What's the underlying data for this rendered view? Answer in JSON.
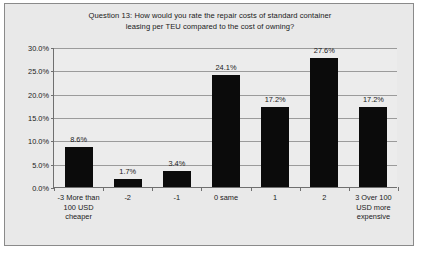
{
  "chart_data": {
    "type": "bar",
    "title": "Question 13: How would you rate the repair costs of standard container leasing per TEU compared to the cost of owning?",
    "title_line1": "Question 13: How would you rate the repair costs of standard container",
    "title_line2": "leasing per TEU compared to the cost of owning?",
    "xlabel": "",
    "ylabel": "",
    "ylim": [
      0,
      30
    ],
    "grid": true,
    "legend": "none",
    "categories": [
      "-3 More than 100 USD cheaper",
      "-2",
      "-1",
      "0 same",
      "1",
      "2",
      "3 Over 100 USD more expensive"
    ],
    "values": [
      8.6,
      1.7,
      3.4,
      24.1,
      17.2,
      27.6,
      17.2
    ],
    "data_labels": [
      "8.6%",
      "1.7%",
      "3.4%",
      "24.1%",
      "17.2%",
      "27.6%",
      "17.2%"
    ],
    "ytick_labels": [
      "0.0%",
      "5.0%",
      "10.0%",
      "15.0%",
      "20.0%",
      "25.0%",
      "30.0%"
    ],
    "ytick_values": [
      0,
      5,
      10,
      15,
      20,
      25,
      30
    ],
    "bar_color": "#0b0b0b",
    "plot_background": "#ececec",
    "frame_background": "#e9e9e9",
    "gridline_color": "#9b9b9b",
    "axis_color": "#6f6f6f",
    "text_color": "#1a1a1a"
  }
}
